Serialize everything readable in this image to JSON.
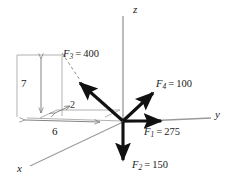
{
  "figure": {
    "type": "3d-force-diagram",
    "width": 236,
    "height": 192,
    "background": "#ffffff",
    "origin": {
      "x": 123,
      "y": 122
    }
  },
  "colors": {
    "force_vector": "#111111",
    "axis": "#9a9a9a",
    "construction": "#a8a8a8",
    "dashed": "#8f8f8f",
    "text": "#1a1a1a"
  },
  "axes": [
    {
      "name": "z",
      "label": "z",
      "direction": "vertical-up",
      "label_x": 134,
      "label_y": 5
    },
    {
      "name": "y",
      "label": "y",
      "direction": "horizontal-right",
      "label_x": 216,
      "label_y": 110
    },
    {
      "name": "x",
      "label": "x",
      "direction": "diagonal-lower-left",
      "label_x": 18,
      "label_y": 164
    }
  ],
  "forces": [
    {
      "id": "F1",
      "symbol": "F",
      "subscript": "1",
      "equals": "=",
      "magnitude": "275",
      "label": "F1 = 275",
      "direction": "+y horizontal right",
      "label_x": 144,
      "label_y": 128
    },
    {
      "id": "F2",
      "symbol": "F",
      "subscript": "2",
      "equals": "=",
      "magnitude": "150",
      "label": "F2 = 150",
      "direction": "-z vertical down",
      "label_x": 131,
      "label_y": 161
    },
    {
      "id": "F3",
      "symbol": "F",
      "subscript": "3",
      "equals": "=",
      "magnitude": "400",
      "label": "F3 = 400",
      "direction": "upper-left, toward box corner",
      "label_x": 63,
      "label_y": 50
    },
    {
      "id": "F4",
      "symbol": "F",
      "subscript": "4",
      "equals": "=",
      "magnitude": "100",
      "label": "F4 = 100",
      "direction": "upper-right diagonal",
      "label_x": 158,
      "label_y": 80
    }
  ],
  "dimensions": [
    {
      "id": "dim-7",
      "value": "7",
      "orientation": "vertical",
      "label_x": 21,
      "label_y": 79
    },
    {
      "id": "dim-6",
      "value": "6",
      "orientation": "horizontal",
      "label_x": 52,
      "label_y": 127
    },
    {
      "id": "dim-2",
      "value": "2",
      "orientation": "slanted",
      "label_x": 70,
      "label_y": 103
    }
  ]
}
